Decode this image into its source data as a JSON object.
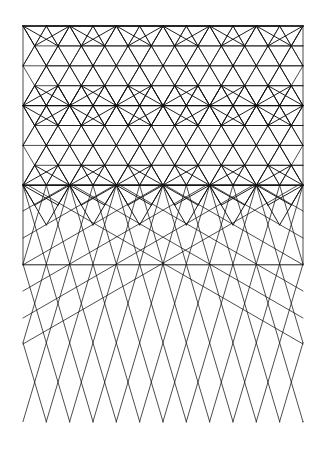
{
  "figure": {
    "title": "Geometric line pattern: star rosette lattice transitioning to diamond lattice",
    "background": "#ffffff",
    "stroke": "#111111",
    "bounds": {
      "left": 23,
      "right": 303,
      "top": 26,
      "bottom": 422
    },
    "rosette_zone": {
      "hub_rows_y": [
        26,
        105.6,
        185.2
      ],
      "hub_spacing_x": 46.67,
      "fine_spacing_x": 23.33,
      "fine_row_pitch": 19.9,
      "ray_radius": 48
    },
    "transition_row_y": 264.8,
    "diamond_zone": {
      "vertex_spacing_x": 23.33,
      "top_y": 185.2,
      "row_pitch": 39.4,
      "bottom_y": 422
    },
    "diagonal_lines": {
      "angle_deg": 30,
      "edge_start_y": [
        211,
        238,
        264.8,
        291,
        318,
        344
      ],
      "center_hub": [
        163,
        264.8
      ]
    }
  }
}
